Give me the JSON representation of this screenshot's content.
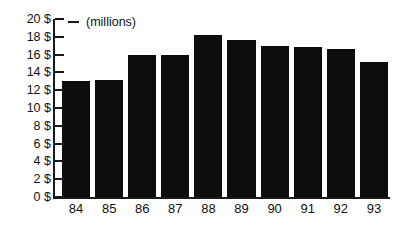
{
  "chart_data": {
    "type": "bar",
    "title": "",
    "subtitle": "",
    "units_note": "(millions)",
    "xlabel": "",
    "ylabel": "",
    "categories": [
      "84",
      "85",
      "86",
      "87",
      "88",
      "89",
      "90",
      "91",
      "92",
      "93"
    ],
    "values": [
      13.0,
      13.2,
      16.0,
      16.0,
      18.2,
      17.6,
      17.0,
      16.8,
      16.6,
      15.2
    ],
    "series": [
      {
        "name": "Revenue",
        "values": [
          13.0,
          13.2,
          16.0,
          16.0,
          18.2,
          17.6,
          17.0,
          16.8,
          16.6,
          15.2
        ]
      }
    ],
    "ylim": [
      0,
      20
    ],
    "ytick_values": [
      0,
      2,
      4,
      6,
      8,
      10,
      12,
      14,
      16,
      18,
      20
    ],
    "ytick_labels": [
      "0 $",
      "2 $",
      "4 $",
      "6 $",
      "8 $",
      "10 $",
      "12 $",
      "14 $",
      "16 $",
      "18 $",
      "20 $"
    ],
    "grid": false,
    "legend": null,
    "bar_color": "#0d0d0d",
    "axis_color": "#1a1a1a",
    "background_color": "#ffffff"
  }
}
